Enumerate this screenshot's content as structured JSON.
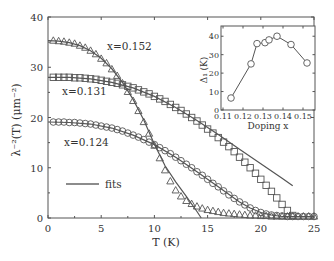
{
  "chart_data": [
    {
      "type": "scatter",
      "title": "",
      "xlabel": "T (K)",
      "ylabel": "λ⁻²(T) (μm⁻²)",
      "xlim": [
        0,
        25
      ],
      "ylim": [
        0,
        40
      ],
      "xticks": [
        0,
        5,
        10,
        15,
        20,
        25
      ],
      "yticks": [
        0,
        10,
        20,
        30,
        40
      ],
      "grid": false,
      "legend": {
        "entries": [
          "fits"
        ],
        "position": "lower-left"
      },
      "annotations": [
        "x=0.152",
        "x=0.131",
        "x=0.124"
      ],
      "series": [
        {
          "name": "x=0.152",
          "marker": "triangle",
          "x": [
            0.5,
            1,
            1.5,
            2,
            2.5,
            3,
            3.5,
            4,
            4.5,
            5,
            5.5,
            6,
            6.5,
            7,
            7.5,
            8,
            8.5,
            9,
            9.5,
            10,
            10.5,
            11,
            11.5,
            12,
            12.5,
            13,
            13.5,
            14,
            14.5,
            15,
            15.5,
            16,
            16.5,
            17,
            17.5,
            18,
            18.5,
            19,
            19.5,
            20,
            20.5,
            21,
            21.5,
            22,
            22.5,
            23,
            23.5,
            24,
            24.5,
            25
          ],
          "y": [
            35.3,
            35.2,
            35.1,
            34.9,
            34.7,
            34.3,
            33.9,
            33.3,
            32.6,
            31.7,
            30.8,
            29.6,
            28.3,
            26.8,
            25.1,
            23.3,
            21.3,
            19.1,
            16.8,
            14.4,
            11.9,
            9.5,
            7.3,
            5.5,
            4.3,
            3.4,
            2.8,
            2.3,
            1.9,
            1.6,
            1.4,
            1.2,
            1.0,
            0.9,
            0.8,
            0.7,
            0.6,
            0.5,
            0.5,
            0.4,
            0.4,
            0.3,
            0.3,
            0.3,
            0.3,
            0.3,
            0.3,
            0.3,
            0.3,
            0.3
          ]
        },
        {
          "name": "x=0.131",
          "marker": "square",
          "x": [
            0.5,
            1,
            1.5,
            2,
            2.5,
            3,
            3.5,
            4,
            4.5,
            5,
            5.5,
            6,
            6.5,
            7,
            7.5,
            8,
            8.5,
            9,
            9.5,
            10,
            10.5,
            11,
            11.5,
            12,
            12.5,
            13,
            13.5,
            14,
            14.5,
            15,
            15.5,
            16,
            16.5,
            17,
            17.5,
            18,
            18.5,
            19,
            19.5,
            20,
            20.5,
            21,
            21.5,
            22,
            22.5,
            23
          ],
          "y": [
            28,
            28,
            28,
            28,
            27.9,
            27.9,
            27.8,
            27.7,
            27.6,
            27.4,
            27.2,
            27,
            26.8,
            26.5,
            26.2,
            25.9,
            25.5,
            25.1,
            24.7,
            24.2,
            23.7,
            23.2,
            22.6,
            22,
            21.4,
            20.7,
            20,
            19.3,
            18.5,
            17.7,
            16.9,
            16,
            15.1,
            14.2,
            13.2,
            12.1,
            11.1,
            10,
            8.9,
            7.7,
            6.5,
            5.3,
            4,
            2.7,
            1.5,
            0.5
          ]
        },
        {
          "name": "x=0.124",
          "marker": "circle",
          "x": [
            0.5,
            1,
            1.5,
            2,
            2.5,
            3,
            3.5,
            4,
            4.5,
            5,
            5.5,
            6,
            6.5,
            7,
            7.5,
            8,
            8.5,
            9,
            9.5,
            10,
            10.5,
            11,
            11.5,
            12,
            12.5,
            13,
            13.5,
            14,
            14.5,
            15,
            15.5,
            16,
            16.5,
            17,
            17.5,
            18,
            18.5,
            19,
            19.5,
            20,
            20.5,
            21,
            21.5,
            22,
            22.5,
            23,
            23.5,
            24,
            24.5,
            25
          ],
          "y": [
            19.1,
            19.1,
            19.1,
            19,
            19,
            18.9,
            18.8,
            18.7,
            18.5,
            18.3,
            18.1,
            17.9,
            17.6,
            17.3,
            16.9,
            16.5,
            16.1,
            15.6,
            15.1,
            14.6,
            14,
            13.4,
            12.8,
            12.1,
            11.4,
            10.7,
            10,
            9.2,
            8.5,
            7.7,
            6.9,
            6.2,
            5.4,
            4.6,
            3.9,
            3.2,
            2.6,
            2,
            1.5,
            1.1,
            0.8,
            0.6,
            0.5,
            0.4,
            0.3,
            0.3,
            0.3,
            0.3,
            0.3,
            0.3
          ]
        }
      ],
      "fits": [
        {
          "name": "fit x=0.152",
          "x": [
            0,
            1,
            2,
            3,
            4,
            5,
            6,
            7,
            8,
            9,
            10,
            11,
            12,
            13,
            14,
            14.4
          ],
          "y": [
            35.3,
            35.2,
            34.9,
            34.3,
            33.3,
            31.8,
            29.7,
            27,
            23.6,
            19.5,
            14.7,
            10.4,
            7.2,
            4.3,
            1.3,
            0
          ]
        },
        {
          "name": "fit x=0.131",
          "x": [
            0,
            2,
            4,
            6,
            8,
            10,
            12,
            14,
            16,
            18,
            20,
            22,
            23
          ],
          "y": [
            28,
            28,
            27.7,
            27,
            25.9,
            24.2,
            22,
            19.4,
            16.6,
            13.7,
            10.8,
            7.9,
            6.4
          ]
        },
        {
          "name": "fit x=0.124",
          "x": [
            0,
            2,
            4,
            6,
            8,
            10,
            12,
            14,
            16,
            18,
            19,
            20,
            21,
            22,
            25
          ],
          "y": [
            19.1,
            19,
            18.7,
            17.9,
            16.5,
            14.6,
            12.1,
            9.2,
            6.2,
            3.2,
            2,
            1.1,
            0.6,
            0.3,
            0.3
          ]
        }
      ]
    },
    {
      "type": "line",
      "title": "inset",
      "xlabel": "Doping x",
      "ylabel": "Δ₁ (K)",
      "xlim": [
        0.11,
        0.155
      ],
      "ylim": [
        0,
        45
      ],
      "xticks": [
        0.11,
        0.12,
        0.13,
        0.14,
        0.15
      ],
      "yticks": [
        0,
        10,
        20,
        30,
        40
      ],
      "grid": false,
      "x": [
        0.114,
        0.124,
        0.127,
        0.131,
        0.133,
        0.137,
        0.144,
        0.152
      ],
      "y": [
        6.5,
        25,
        36,
        36.5,
        38,
        40,
        35.5,
        25.5
      ]
    }
  ],
  "labels": {
    "annot_152": "x=0.152",
    "annot_131": "x=0.131",
    "annot_124": "x=0.124",
    "legend_fits": "fits",
    "xlabel": "T (K)",
    "ylabel": "λ⁻²(T) (μm⁻²)",
    "inset_xlabel": "Doping x",
    "inset_ylabel": "Δ₁ (K)"
  }
}
